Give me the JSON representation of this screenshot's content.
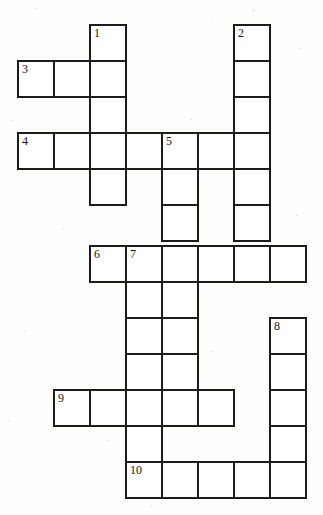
{
  "page": {
    "type": "blank-crossword-grid",
    "width": 323,
    "height": 515,
    "background_color": "#fdfdfc",
    "cell_border_color": "#1c1c1c",
    "cell_fill_color": "#ffffff",
    "number_color": "#151515"
  },
  "geometry": {
    "cell_width": 36,
    "cell_height": 36,
    "col_x": [
      17,
      53,
      89,
      125,
      161,
      197,
      233,
      269,
      305
    ],
    "row_y": [
      24,
      60,
      96,
      132,
      168,
      204,
      245,
      281,
      317,
      353,
      389,
      425,
      461
    ],
    "note": "col index 0..8 left-to-right, row index 0..12 top-to-bottom"
  },
  "entries": [
    {
      "number": "1",
      "direction": "down",
      "start_col": 2,
      "start_row": 0,
      "length": 5
    },
    {
      "number": "2",
      "direction": "down",
      "start_col": 6,
      "start_row": 0,
      "length": 6
    },
    {
      "number": "3",
      "direction": "across",
      "start_col": 0,
      "start_row": 1,
      "length": 3
    },
    {
      "number": "4",
      "direction": "across",
      "start_col": 0,
      "start_row": 3,
      "length": 7
    },
    {
      "number": "5",
      "direction": "down",
      "start_col": 4,
      "start_row": 3,
      "length": 8
    },
    {
      "number": "6",
      "direction": "across",
      "start_col": 2,
      "start_row": 6,
      "length": 6
    },
    {
      "number": "7",
      "direction": "down",
      "start_col": 3,
      "start_row": 6,
      "length": 7
    },
    {
      "number": "8",
      "direction": "down",
      "start_col": 7,
      "start_row": 8,
      "length": 5
    },
    {
      "number": "9",
      "direction": "across",
      "start_col": 1,
      "start_row": 10,
      "length": 5
    },
    {
      "number": "10",
      "direction": "across",
      "start_col": 3,
      "start_row": 12,
      "length": 5
    }
  ],
  "cells": [
    {
      "col": 2,
      "row": 0,
      "number": "1"
    },
    {
      "col": 6,
      "row": 0,
      "number": "2"
    },
    {
      "col": 0,
      "row": 1,
      "number": "3"
    },
    {
      "col": 1,
      "row": 1,
      "number": ""
    },
    {
      "col": 2,
      "row": 1,
      "number": ""
    },
    {
      "col": 6,
      "row": 1,
      "number": ""
    },
    {
      "col": 2,
      "row": 2,
      "number": ""
    },
    {
      "col": 6,
      "row": 2,
      "number": ""
    },
    {
      "col": 0,
      "row": 3,
      "number": "4"
    },
    {
      "col": 1,
      "row": 3,
      "number": ""
    },
    {
      "col": 2,
      "row": 3,
      "number": ""
    },
    {
      "col": 3,
      "row": 3,
      "number": ""
    },
    {
      "col": 4,
      "row": 3,
      "number": "5"
    },
    {
      "col": 5,
      "row": 3,
      "number": ""
    },
    {
      "col": 6,
      "row": 3,
      "number": ""
    },
    {
      "col": 2,
      "row": 4,
      "number": ""
    },
    {
      "col": 4,
      "row": 4,
      "number": ""
    },
    {
      "col": 6,
      "row": 4,
      "number": ""
    },
    {
      "col": 4,
      "row": 5,
      "number": ""
    },
    {
      "col": 6,
      "row": 5,
      "number": ""
    },
    {
      "col": 2,
      "row": 6,
      "number": "6"
    },
    {
      "col": 3,
      "row": 6,
      "number": "7"
    },
    {
      "col": 4,
      "row": 6,
      "number": ""
    },
    {
      "col": 5,
      "row": 6,
      "number": ""
    },
    {
      "col": 6,
      "row": 6,
      "number": ""
    },
    {
      "col": 7,
      "row": 6,
      "number": ""
    },
    {
      "col": 3,
      "row": 7,
      "number": ""
    },
    {
      "col": 4,
      "row": 7,
      "number": ""
    },
    {
      "col": 3,
      "row": 8,
      "number": ""
    },
    {
      "col": 4,
      "row": 8,
      "number": ""
    },
    {
      "col": 7,
      "row": 8,
      "number": "8"
    },
    {
      "col": 3,
      "row": 9,
      "number": ""
    },
    {
      "col": 4,
      "row": 9,
      "number": ""
    },
    {
      "col": 7,
      "row": 9,
      "number": ""
    },
    {
      "col": 1,
      "row": 10,
      "number": "9"
    },
    {
      "col": 2,
      "row": 10,
      "number": ""
    },
    {
      "col": 3,
      "row": 10,
      "number": ""
    },
    {
      "col": 4,
      "row": 10,
      "number": ""
    },
    {
      "col": 5,
      "row": 10,
      "number": ""
    },
    {
      "col": 7,
      "row": 10,
      "number": ""
    },
    {
      "col": 3,
      "row": 11,
      "number": ""
    },
    {
      "col": 7,
      "row": 11,
      "number": ""
    },
    {
      "col": 3,
      "row": 12,
      "number": "10"
    },
    {
      "col": 4,
      "row": 12,
      "number": ""
    },
    {
      "col": 5,
      "row": 12,
      "number": ""
    },
    {
      "col": 6,
      "row": 12,
      "number": ""
    },
    {
      "col": 7,
      "row": 12,
      "number": ""
    }
  ],
  "specks": [
    {
      "x": 36,
      "y": 8,
      "d": 2
    },
    {
      "x": 210,
      "y": 18,
      "d": 2
    },
    {
      "x": 252,
      "y": 9,
      "d": 3
    },
    {
      "x": 300,
      "y": 48,
      "d": 2
    },
    {
      "x": 10,
      "y": 120,
      "d": 2
    },
    {
      "x": 190,
      "y": 118,
      "d": 2
    },
    {
      "x": 62,
      "y": 228,
      "d": 2
    },
    {
      "x": 296,
      "y": 214,
      "d": 2
    },
    {
      "x": 24,
      "y": 330,
      "d": 2
    },
    {
      "x": 210,
      "y": 350,
      "d": 2
    },
    {
      "x": 108,
      "y": 440,
      "d": 2
    },
    {
      "x": 286,
      "y": 486,
      "d": 2
    },
    {
      "x": 150,
      "y": 505,
      "d": 2
    },
    {
      "x": 8,
      "y": 420,
      "d": 2
    }
  ]
}
